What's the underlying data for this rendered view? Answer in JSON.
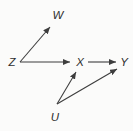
{
  "diagram": {
    "background_color": "#fbfbfa",
    "line_color": "#3d3d3d",
    "label_color": "#2e2e2e",
    "nodes": [
      {
        "id": "W",
        "label": "W",
        "x": 58,
        "y": 15
      },
      {
        "id": "Z",
        "label": "Z",
        "x": 12,
        "y": 62
      },
      {
        "id": "X",
        "label": "X",
        "x": 80,
        "y": 62
      },
      {
        "id": "Y",
        "label": "Y",
        "x": 124,
        "y": 62
      },
      {
        "id": "U",
        "label": "U",
        "x": 55,
        "y": 117
      }
    ],
    "edges": [
      {
        "from": "Z",
        "to": "W",
        "x1": 20,
        "y1": 62,
        "x2": 50,
        "y2": 27,
        "arrowhead": "end"
      },
      {
        "from": "Z",
        "to": "X",
        "x1": 20,
        "y1": 62,
        "x2": 70,
        "y2": 62,
        "arrowhead": "end"
      },
      {
        "from": "X",
        "to": "Y",
        "x1": 88,
        "y1": 62,
        "x2": 116,
        "y2": 62,
        "arrowhead": "end"
      },
      {
        "from": "U",
        "to": "X",
        "x1": 57,
        "y1": 104,
        "x2": 76,
        "y2": 72,
        "arrowhead": "end"
      },
      {
        "from": "U",
        "to": "Y",
        "x1": 57,
        "y1": 104,
        "x2": 117,
        "y2": 69,
        "arrowhead": "end"
      }
    ]
  }
}
